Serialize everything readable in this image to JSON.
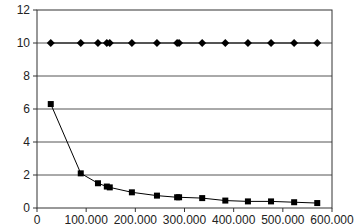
{
  "chart_data": {
    "type": "line",
    "title": "",
    "xlabel": "",
    "ylabel": "",
    "xlim": [
      0,
      600000
    ],
    "ylim": [
      0,
      12
    ],
    "grid": {
      "horizontal": true,
      "vertical": false
    },
    "legend": null,
    "x_ticks": [
      "0",
      "100,000",
      "200,000",
      "300,000",
      "400,000",
      "500,000",
      "600,000"
    ],
    "y_ticks": [
      "0",
      "2",
      "4",
      "6",
      "8",
      "10",
      "12"
    ],
    "series": [
      {
        "name": "Series A (diamonds)",
        "marker": "diamond",
        "color": "#000000",
        "x": [
          28000,
          89000,
          124000,
          142000,
          148000,
          193000,
          244000,
          285000,
          289000,
          336000,
          383000,
          429000,
          476000,
          523000,
          570000
        ],
        "y": [
          10,
          10,
          10,
          10,
          10,
          10,
          10,
          10,
          10,
          10,
          10,
          10,
          10,
          10,
          10
        ]
      },
      {
        "name": "Series B (squares)",
        "marker": "square",
        "color": "#000000",
        "x": [
          28000,
          89000,
          124000,
          142000,
          148000,
          193000,
          244000,
          285000,
          289000,
          336000,
          383000,
          429000,
          476000,
          523000,
          570000
        ],
        "y": [
          6.3,
          2.1,
          1.5,
          1.3,
          1.25,
          0.95,
          0.75,
          0.65,
          0.65,
          0.6,
          0.45,
          0.4,
          0.4,
          0.35,
          0.3
        ]
      }
    ]
  }
}
